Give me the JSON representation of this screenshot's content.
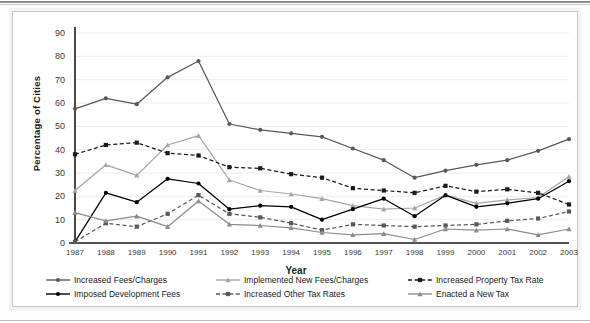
{
  "chart_data": {
    "type": "line",
    "title": "",
    "xlabel": "Year",
    "ylabel": "Percentage of Cities",
    "ylim": [
      0,
      90
    ],
    "ytick_step": 10,
    "yticks": [
      0,
      10,
      20,
      30,
      40,
      50,
      60,
      70,
      80,
      90
    ],
    "grid": true,
    "legend_position": "bottom",
    "categories": [
      "1987",
      "1988",
      "1989",
      "1990",
      "1991",
      "1992",
      "1993",
      "1994",
      "1995",
      "1996",
      "1997",
      "1998",
      "1999",
      "2000",
      "2001",
      "2002",
      "2003"
    ],
    "series": [
      {
        "name": "Increased Fees/Charges",
        "color": "#595959",
        "dash": "none",
        "marker": "circle",
        "values": [
          57.5,
          62.0,
          59.5,
          71.0,
          78.0,
          51.0,
          48.5,
          47.0,
          45.5,
          40.5,
          35.5,
          28.0,
          31.0,
          33.5,
          35.5,
          39.5,
          44.5
        ]
      },
      {
        "name": "Implemented New Fees/Charges",
        "color": "#a6a6a6",
        "dash": "none",
        "marker": "triangle",
        "values": [
          22.5,
          33.5,
          29.0,
          42.0,
          46.0,
          27.0,
          22.5,
          21.0,
          19.0,
          16.0,
          14.5,
          15.0,
          20.5,
          17.0,
          18.5,
          19.5,
          28.5
        ]
      },
      {
        "name": "Increased Property Tax Rate",
        "color": "#1a1a1a",
        "dash": "dash",
        "marker": "square",
        "values": [
          38.0,
          42.0,
          43.0,
          38.5,
          37.5,
          32.5,
          32.0,
          29.5,
          28.0,
          23.5,
          22.5,
          21.5,
          24.5,
          22.0,
          23.0,
          21.5,
          16.5
        ]
      },
      {
        "name": "Imposed Development Fees",
        "color": "#000000",
        "dash": "none",
        "marker": "circle",
        "values": [
          0.5,
          21.5,
          17.5,
          27.5,
          25.5,
          14.5,
          16.0,
          15.5,
          10.0,
          14.5,
          19.0,
          11.5,
          20.5,
          15.5,
          17.0,
          19.0,
          26.5
        ]
      },
      {
        "name": "Increased Other Tax Rates",
        "color": "#595959",
        "dash": "dash",
        "marker": "square",
        "values": [
          0.5,
          8.5,
          7.0,
          12.5,
          20.5,
          12.5,
          11.0,
          8.5,
          5.5,
          8.0,
          7.5,
          7.0,
          7.5,
          8.0,
          9.5,
          10.5,
          13.5
        ]
      },
      {
        "name": "Enacted a New Tax",
        "color": "#8c8c8c",
        "dash": "none",
        "marker": "triangle",
        "values": [
          13.0,
          9.5,
          11.5,
          7.0,
          18.0,
          8.0,
          7.5,
          6.5,
          4.5,
          3.5,
          4.0,
          1.5,
          6.0,
          5.5,
          6.0,
          3.5,
          6.0
        ]
      }
    ]
  },
  "legend": {
    "items": [
      {
        "label": "Increased Fees/Charges",
        "series_index": 0
      },
      {
        "label": "Implemented New Fees/Charges",
        "series_index": 1
      },
      {
        "label": "Increased Property Tax Rate",
        "series_index": 2
      },
      {
        "label": "Imposed Development Fees",
        "series_index": 3
      },
      {
        "label": "Increased Other Tax Rates",
        "series_index": 4
      },
      {
        "label": "Enacted a New Tax",
        "series_index": 5
      }
    ]
  }
}
